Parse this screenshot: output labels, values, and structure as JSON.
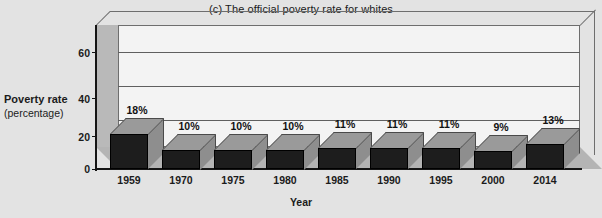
{
  "chart_data": {
    "type": "bar",
    "title": "(c) The official poverty rate for whites",
    "xlabel": "Year",
    "ylabel": "Poverty rate",
    "ylabel_sub": "(percentage)",
    "categories": [
      "1959",
      "1970",
      "1975",
      "1980",
      "1985",
      "1990",
      "1995",
      "2000",
      "2014"
    ],
    "values": [
      18,
      10,
      10,
      10,
      11,
      11,
      11,
      9,
      13
    ],
    "value_labels": [
      "18%",
      "10%",
      "10%",
      "10%",
      "11%",
      "11%",
      "11%",
      "9%",
      "13%"
    ],
    "ylim": [
      0,
      70
    ],
    "yticks": [
      0,
      20,
      40,
      60
    ],
    "ytick_labels": [
      "0",
      "20",
      "40",
      "60"
    ],
    "grid": true,
    "grid_axis": "y",
    "legend": null,
    "style": "3d-column",
    "colors": {
      "background": "#e3e3e3",
      "plot_area": "#f3f3f3",
      "bar_front": "#1d1d1d",
      "bar_top": "#9a9a9a",
      "bar_side": "#8e8e8e",
      "floor": "#b4b4b4",
      "wall": "#b9b9b9",
      "gridline": "#5f5f5f",
      "text": "#1b1b1b"
    }
  }
}
